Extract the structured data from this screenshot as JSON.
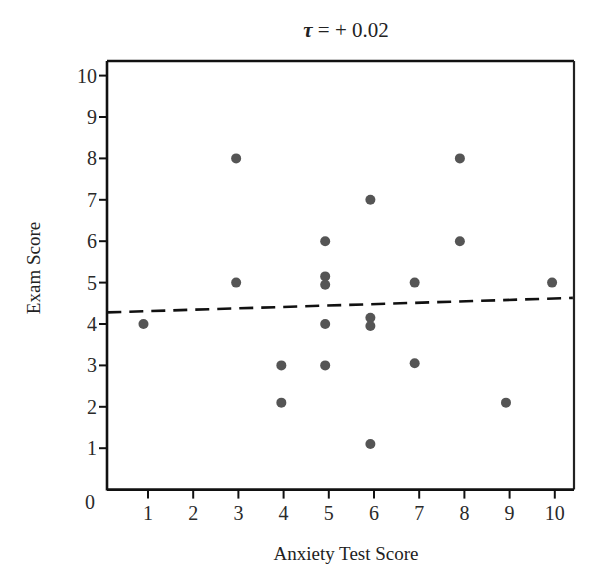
{
  "chart_data": {
    "type": "scatter",
    "title": "τ = + 0.02",
    "title_symbol": "τ",
    "title_rest": " = + 0.02",
    "xlabel": "Anxiety Test Score",
    "ylabel": "Exam Score",
    "xlim": [
      0,
      10.4
    ],
    "ylim": [
      0,
      10.35
    ],
    "x_ticks": [
      1,
      2,
      3,
      4,
      5,
      6,
      7,
      8,
      9,
      10
    ],
    "x_tick_labels": [
      "1",
      "2",
      "3",
      "4",
      "5",
      "6",
      "7",
      "8",
      "9",
      "10"
    ],
    "y_ticks": [
      1,
      2,
      3,
      4,
      5,
      6,
      7,
      8,
      9,
      10
    ],
    "y_tick_labels": [
      "1",
      "2",
      "3",
      "4",
      "5",
      "6",
      "7",
      "8",
      "9",
      "10"
    ],
    "origin_label": "0",
    "grid": false,
    "legend": "none",
    "point_color": "#555555",
    "points": [
      {
        "x": 0.9,
        "y": 4.0
      },
      {
        "x": 2.95,
        "y": 8.0
      },
      {
        "x": 2.95,
        "y": 5.0
      },
      {
        "x": 3.95,
        "y": 3.0
      },
      {
        "x": 3.95,
        "y": 2.1
      },
      {
        "x": 4.92,
        "y": 6.0
      },
      {
        "x": 4.92,
        "y": 5.15
      },
      {
        "x": 4.92,
        "y": 4.95
      },
      {
        "x": 4.92,
        "y": 4.0
      },
      {
        "x": 4.92,
        "y": 3.0
      },
      {
        "x": 5.92,
        "y": 7.0
      },
      {
        "x": 5.92,
        "y": 4.15
      },
      {
        "x": 5.92,
        "y": 3.95
      },
      {
        "x": 5.92,
        "y": 1.1
      },
      {
        "x": 6.9,
        "y": 5.0
      },
      {
        "x": 6.9,
        "y": 3.05
      },
      {
        "x": 7.9,
        "y": 8.0
      },
      {
        "x": 7.9,
        "y": 6.0
      },
      {
        "x": 8.92,
        "y": 2.1
      },
      {
        "x": 9.94,
        "y": 5.0
      }
    ],
    "trend_line": {
      "style": "dashed",
      "color": "#111111",
      "x": [
        0.1,
        10.4
      ],
      "y": [
        4.28,
        4.63
      ]
    }
  }
}
